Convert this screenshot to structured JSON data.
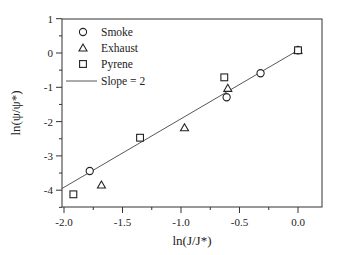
{
  "chart_data": {
    "type": "scatter",
    "title": "",
    "xlabel": "ln(J/J*)",
    "ylabel": "ln(ψ/ψ*)",
    "xlim": [
      -2.0,
      0.2
    ],
    "ylim": [
      -4.5,
      1.0
    ],
    "xticks": [
      -2.0,
      -1.5,
      -1.0,
      -0.5,
      0.0
    ],
    "xtick_labels": [
      "-2.0",
      "-1.5",
      "-1.0",
      "-0.5",
      "0.0"
    ],
    "yticks": [
      1,
      0,
      -1,
      -2,
      -3,
      -4
    ],
    "ytick_labels": [
      "1",
      "0",
      "-1",
      "-2",
      "-3",
      "-4"
    ],
    "grid": false,
    "legend_position": "upper left",
    "series": [
      {
        "name": "Smoke",
        "marker": "circle",
        "points": [
          [
            -1.78,
            -3.44
          ],
          [
            -0.61,
            -1.29
          ],
          [
            -0.32,
            -0.59
          ],
          [
            0.0,
            0.08
          ]
        ]
      },
      {
        "name": "Exhaust",
        "marker": "triangle",
        "points": [
          [
            -1.68,
            -3.85
          ],
          [
            -0.97,
            -2.18
          ],
          [
            -0.6,
            -1.03
          ],
          [
            0.0,
            0.08
          ]
        ]
      },
      {
        "name": "Pyrene",
        "marker": "square",
        "points": [
          [
            -1.92,
            -4.12
          ],
          [
            -1.35,
            -2.47
          ],
          [
            -0.63,
            -0.71
          ],
          [
            0.0,
            0.08
          ]
        ]
      },
      {
        "name": "Slope = 2",
        "marker": "line",
        "points": [
          [
            -2.0,
            -3.95
          ],
          [
            0.0,
            0.08
          ]
        ]
      }
    ]
  },
  "legend": {
    "items": [
      {
        "label": "Smoke",
        "marker": "circle"
      },
      {
        "label": "Exhaust",
        "marker": "triangle"
      },
      {
        "label": "Pyrene",
        "marker": "square"
      },
      {
        "label": "Slope = 2",
        "marker": "line"
      }
    ]
  }
}
